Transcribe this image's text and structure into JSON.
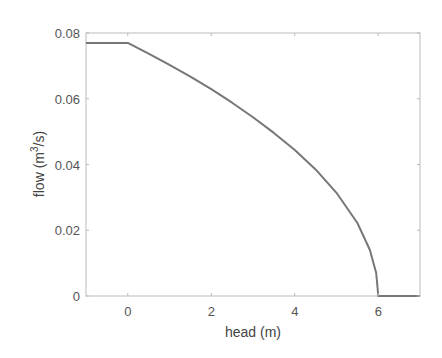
{
  "chart_data": {
    "type": "line",
    "title": "",
    "xlabel": "head (m)",
    "ylabel": "flow (m^3/s)",
    "ylabel_parts": {
      "pre": "flow (m",
      "sup": "3",
      "post": "/s)"
    },
    "xlim": [
      -1,
      7
    ],
    "ylim": [
      0,
      0.08
    ],
    "xticks": [
      0,
      2,
      4,
      6
    ],
    "xtick_labels": [
      "0",
      "2",
      "4",
      "6"
    ],
    "yticks": [
      0,
      0.02,
      0.04,
      0.06,
      0.08
    ],
    "ytick_labels": [
      "0",
      "0.02",
      "0.04",
      "0.06",
      "0.08"
    ],
    "grid": false,
    "legend": null,
    "series": [
      {
        "name": "pump curve",
        "color": "#777777",
        "x": [
          -1,
          0,
          0.5,
          1,
          1.5,
          2,
          2.5,
          3,
          3.5,
          4,
          4.5,
          5,
          5.5,
          5.8,
          5.95,
          6,
          7
        ],
        "y": [
          0.077,
          0.077,
          0.0737,
          0.0703,
          0.0667,
          0.0629,
          0.0588,
          0.0544,
          0.0496,
          0.0444,
          0.0385,
          0.0314,
          0.0222,
          0.014,
          0.007,
          0,
          0
        ]
      }
    ]
  },
  "colors": {
    "axis": "#bbbbbb",
    "line": "#777777",
    "text": "#555555"
  }
}
